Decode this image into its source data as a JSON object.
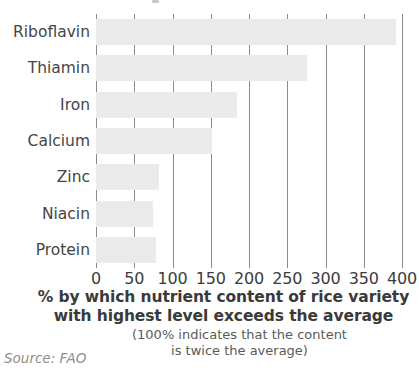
{
  "chart_data": {
    "type": "bar",
    "orientation": "horizontal",
    "title": "",
    "categories": [
      "Riboflavin",
      "Thiamin",
      "Iron",
      "Calcium",
      "Zinc",
      "Niacin",
      "Protein"
    ],
    "values": [
      392,
      276,
      184,
      152,
      83,
      75,
      78
    ],
    "xlabel": "% by which nutrient content of rice variety with highest level exceeds the average",
    "ylabel": "",
    "xlim": [
      0,
      400
    ],
    "ylim": null,
    "xticks": [
      0,
      50,
      100,
      150,
      200,
      250,
      300,
      350,
      400
    ],
    "xtick_labels": [
      "0",
      "50",
      "100",
      "150",
      "200",
      "250",
      "300",
      "350",
      "400"
    ],
    "grid": true,
    "grid_axis": "x",
    "legend": false,
    "legend_position": "none",
    "bar_color": "#ebebeb",
    "gridline_color": "#8c8c8c",
    "annotations": [
      "(100% indicates that the content",
      "is twice the average)"
    ],
    "source": "Source: FAO"
  },
  "axis_caption": {
    "line1": "% by which nutrient content of rice variety",
    "line2": "with highest level exceeds the average"
  },
  "sub_caption": {
    "line1": "(100% indicates that the content",
    "line2": "is twice the average)"
  },
  "source": {
    "text": "Source: FAO"
  }
}
